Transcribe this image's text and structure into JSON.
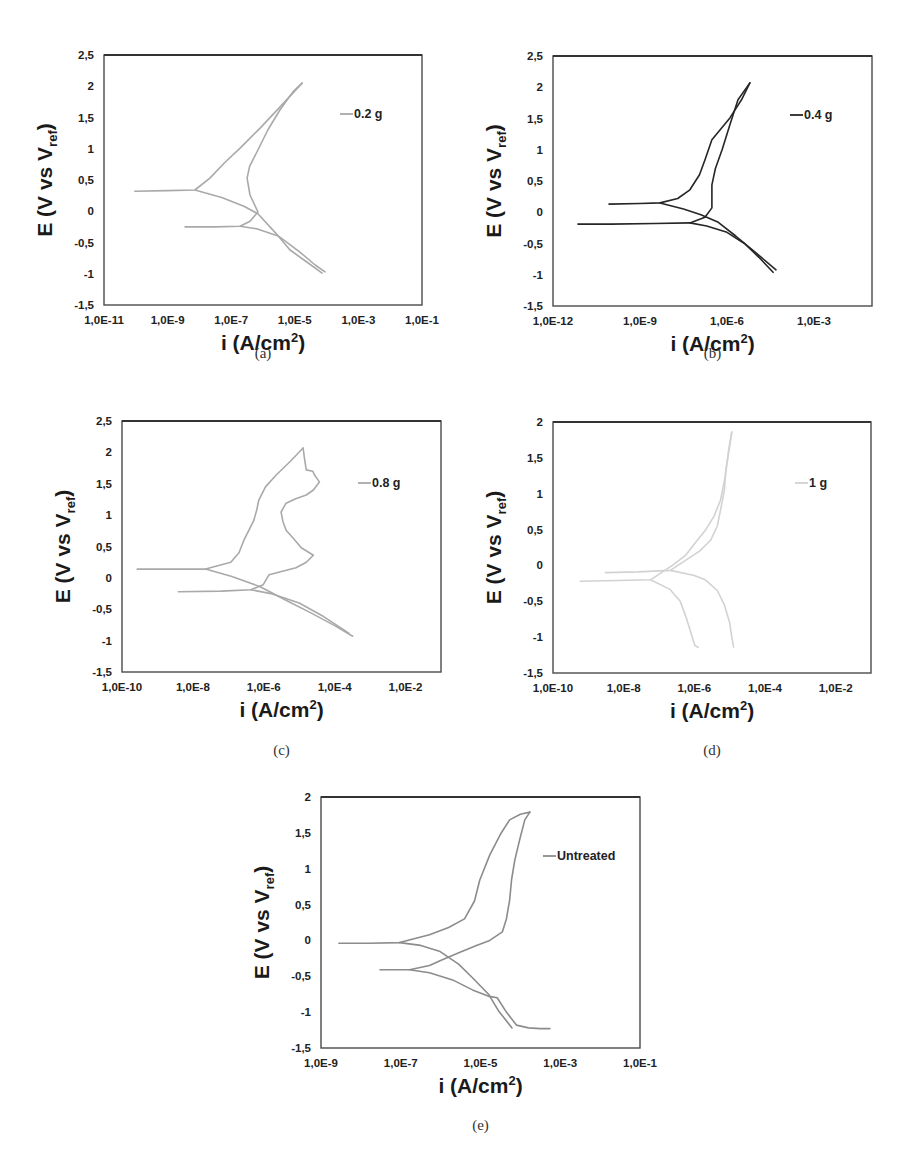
{
  "figure": {
    "header_text": ""
  },
  "chart_data": [
    {
      "id": "a",
      "type": "line",
      "caption": "(a)",
      "title": "",
      "xlabel": "i (A/cm2)",
      "xlabel_main": "i (A/cm",
      "xlabel_sup": "2",
      "xlabel_end": ")",
      "ylabel": "E (V vs Vref)",
      "ylabel_main": "E (V vs V",
      "ylabel_sub": "ref",
      "ylabel_end": ")",
      "xscale": "log",
      "xlim_log10": [
        -11,
        -1
      ],
      "ylim": [
        -1.5,
        2.5
      ],
      "xticks_log10": [
        -11,
        -9,
        -7,
        -5,
        -3,
        -1
      ],
      "xtick_labels": [
        "1,0E-11",
        "1,0E-9",
        "1,0E-7",
        "1,0E-5",
        "1,0E-3",
        "1,0E-1"
      ],
      "yticks": [
        -1.5,
        -1,
        -0.5,
        0,
        0.5,
        1,
        1.5,
        2,
        2.5
      ],
      "ytick_labels": [
        "-1,5",
        "-1",
        "-0,5",
        "0",
        "0,5",
        "1",
        "1,5",
        "2",
        "2,5"
      ],
      "grid": false,
      "legend_position": "top-right",
      "series": [
        {
          "name": "0.2 g",
          "color": "#a9a9a9",
          "segments": [
            {
              "log10_i": [
                -10.03,
                -9.0,
                -8.14,
                -7.67,
                -7.2,
                -6.72,
                -6.09,
                -5.5,
                -4.77
              ],
              "E": [
                0.32,
                0.33,
                0.34,
                0.53,
                0.78,
                1.01,
                1.33,
                1.65,
                2.05
              ]
            },
            {
              "log10_i": [
                -4.77,
                -5.06,
                -5.47,
                -5.85,
                -6.16,
                -6.42,
                -6.5,
                -6.41,
                -6.16,
                -6.41,
                -6.72,
                -7.5,
                -8.45
              ],
              "E": [
                2.05,
                1.91,
                1.62,
                1.3,
                0.98,
                0.72,
                0.53,
                0.26,
                -0.01,
                -0.16,
                -0.24,
                -0.25,
                -0.25
              ]
            },
            {
              "log10_i": [
                -8.14,
                -7.3,
                -6.6,
                -6.16,
                -5.6,
                -5.15,
                -4.6,
                -4.14
              ],
              "E": [
                0.34,
                0.22,
                0.08,
                -0.04,
                -0.35,
                -0.62,
                -0.82,
                -0.99
              ]
            },
            {
              "log10_i": [
                -6.72,
                -6.2,
                -5.5,
                -4.85,
                -4.36,
                -4.05
              ],
              "E": [
                -0.24,
                -0.28,
                -0.4,
                -0.65,
                -0.86,
                -0.97
              ]
            }
          ]
        }
      ]
    },
    {
      "id": "b",
      "type": "line",
      "caption": "(b)",
      "title": "",
      "xlabel": "i (A/cm2)",
      "xlabel_main": "i (A/cm",
      "xlabel_sup": "2",
      "xlabel_end": ")",
      "ylabel": "E (V vs Vref)",
      "ylabel_main": "E (V vs V",
      "ylabel_sub": "ref",
      "ylabel_end": ")",
      "xscale": "log",
      "xlim_log10": [
        -12,
        -1
      ],
      "ylim": [
        -1.5,
        2.5
      ],
      "xticks_log10": [
        -12,
        -9,
        -6,
        -3
      ],
      "xtick_labels": [
        "1,0E-12",
        "1,0E-9",
        "1,0E-6",
        "1,0E-3"
      ],
      "yticks": [
        -1.5,
        -1,
        -0.5,
        0,
        0.5,
        1,
        1.5,
        2,
        2.5
      ],
      "ytick_labels": [
        "-1,5",
        "-1",
        "-0,5",
        "0",
        "0,5",
        "1",
        "1,5",
        "2",
        "2,5"
      ],
      "grid": false,
      "legend_position": "top-right",
      "series": [
        {
          "name": "0.4 g",
          "color": "#262626",
          "segments": [
            {
              "log10_i": [
                -10.07,
                -9.0,
                -8.31,
                -7.7,
                -7.28,
                -6.95,
                -6.76,
                -6.52,
                -5.9,
                -5.5,
                -5.21
              ],
              "E": [
                0.13,
                0.14,
                0.15,
                0.22,
                0.36,
                0.6,
                0.84,
                1.16,
                1.51,
                1.8,
                2.07
              ]
            },
            {
              "log10_i": [
                -5.21,
                -5.62,
                -5.9,
                -6.17,
                -6.4,
                -6.52,
                -6.52,
                -6.76,
                -7.28,
                -8.5,
                -10.0,
                -11.14
              ],
              "E": [
                2.07,
                1.8,
                1.4,
                1.0,
                0.7,
                0.44,
                0.07,
                -0.08,
                -0.17,
                -0.18,
                -0.19,
                -0.19
              ]
            },
            {
              "log10_i": [
                -8.31,
                -7.5,
                -6.9,
                -6.3,
                -5.7,
                -5.0,
                -4.31
              ],
              "E": [
                0.15,
                0.05,
                -0.04,
                -0.16,
                -0.38,
                -0.65,
                -0.92
              ]
            },
            {
              "log10_i": [
                -7.28,
                -6.7,
                -6.0,
                -5.4,
                -4.9,
                -4.41
              ],
              "E": [
                -0.17,
                -0.22,
                -0.32,
                -0.5,
                -0.72,
                -0.96
              ]
            }
          ]
        }
      ]
    },
    {
      "id": "c",
      "type": "line",
      "caption": "(c)",
      "title": "",
      "xlabel": "i (A/cm2)",
      "xlabel_main": "i (A/cm",
      "xlabel_sup": "2",
      "xlabel_end": ")",
      "ylabel": "E (V vs Vref)",
      "ylabel_main": "E (V vs V",
      "ylabel_sub": "ref",
      "ylabel_end": ")",
      "xscale": "log",
      "xlim_log10": [
        -10,
        -1
      ],
      "ylim": [
        -1.5,
        2.5
      ],
      "xticks_log10": [
        -10,
        -8,
        -6,
        -4,
        -2
      ],
      "xtick_labels": [
        "1,0E-10",
        "1,0E-8",
        "1,0E-6",
        "1,0E-4",
        "1,0E-2"
      ],
      "yticks": [
        -1.5,
        -1,
        -0.5,
        0,
        0.5,
        1,
        1.5,
        2,
        2.5
      ],
      "ytick_labels": [
        "-1,5",
        "-1",
        "-0,5",
        "0",
        "0,5",
        "1",
        "1,5",
        "2",
        "2,5"
      ],
      "grid": false,
      "legend_position": "top-right",
      "series": [
        {
          "name": "0.8 g",
          "color": "#a9a9a9",
          "segments": [
            {
              "log10_i": [
                -9.57,
                -8.6,
                -7.64,
                -6.93,
                -6.7,
                -6.56,
                -6.4,
                -6.28,
                -6.2,
                -6.14,
                -5.95,
                -5.65,
                -5.25,
                -4.89
              ],
              "E": [
                0.14,
                0.14,
                0.14,
                0.25,
                0.4,
                0.6,
                0.78,
                0.92,
                1.08,
                1.24,
                1.45,
                1.64,
                1.86,
                2.07
              ]
            },
            {
              "log10_i": [
                -4.89,
                -4.85,
                -4.8,
                -4.62,
                -4.57,
                -4.43,
                -4.6,
                -4.8,
                -5.1,
                -5.37,
                -5.51,
                -5.46,
                -5.37,
                -5.15,
                -4.94,
                -4.6,
                -4.8,
                -5.09,
                -5.5,
                -5.85,
                -6.02,
                -6.36,
                -7.2,
                -8.41
              ],
              "E": [
                2.07,
                1.9,
                1.72,
                1.7,
                1.64,
                1.53,
                1.4,
                1.32,
                1.26,
                1.19,
                1.05,
                0.9,
                0.76,
                0.62,
                0.48,
                0.36,
                0.25,
                0.16,
                0.1,
                0.05,
                -0.11,
                -0.19,
                -0.21,
                -0.22
              ]
            },
            {
              "log10_i": [
                -7.64,
                -6.9,
                -6.1,
                -5.4,
                -4.7,
                -4.0,
                -3.49
              ],
              "E": [
                0.14,
                0.02,
                -0.14,
                -0.35,
                -0.55,
                -0.76,
                -0.93
              ]
            },
            {
              "log10_i": [
                -6.36,
                -5.8,
                -5.0,
                -4.3,
                -3.6
              ],
              "E": [
                -0.19,
                -0.25,
                -0.4,
                -0.62,
                -0.88
              ]
            }
          ]
        }
      ]
    },
    {
      "id": "d",
      "type": "line",
      "caption": "(d)",
      "title": "",
      "xlabel": "i (A/cm2)",
      "xlabel_main": "i (A/cm",
      "xlabel_sup": "2",
      "xlabel_end": ")",
      "ylabel": "E (V vs Vref)",
      "ylabel_main": "E (V vs V",
      "ylabel_sub": "ref",
      "ylabel_end": ")",
      "xscale": "log",
      "xlim_log10": [
        -10,
        -1
      ],
      "ylim": [
        -1.5,
        2
      ],
      "xticks_log10": [
        -10,
        -8,
        -6,
        -4,
        -2
      ],
      "xtick_labels": [
        "1,0E-10",
        "1,0E-8",
        "1,0E-6",
        "1,0E-4",
        "1,0E-2"
      ],
      "yticks": [
        -1.5,
        -1,
        -0.5,
        0,
        0.5,
        1,
        1.5,
        2
      ],
      "ytick_labels": [
        "-1,5",
        "-1",
        "-0,5",
        "0",
        "0,5",
        "1",
        "1,5",
        "2"
      ],
      "grid": false,
      "legend_position": "top-right",
      "series": [
        {
          "name": "1 g",
          "color": "#d2d2d2",
          "segments": [
            {
              "log10_i": [
                -8.52,
                -7.6,
                -6.68,
                -6.25,
                -5.85,
                -5.54,
                -5.35,
                -5.26,
                -5.15,
                -5.11,
                -5.02,
                -4.94
              ],
              "E": [
                -0.1,
                -0.09,
                -0.07,
                0.07,
                0.2,
                0.35,
                0.55,
                0.77,
                1.05,
                1.33,
                1.6,
                1.86
              ]
            },
            {
              "log10_i": [
                -4.94,
                -5.03,
                -5.12,
                -5.26,
                -5.45,
                -5.69,
                -6.0,
                -6.25,
                -6.62,
                -7.24,
                -8.2,
                -9.23
              ],
              "E": [
                1.86,
                1.61,
                1.25,
                0.91,
                0.68,
                0.49,
                0.3,
                0.14,
                0.0,
                -0.2,
                -0.21,
                -0.22
              ]
            },
            {
              "log10_i": [
                -6.68,
                -6.0,
                -5.69,
                -5.35,
                -5.15,
                -5.0,
                -4.94,
                -4.89
              ],
              "E": [
                -0.07,
                -0.14,
                -0.2,
                -0.35,
                -0.55,
                -0.8,
                -1.0,
                -1.14
              ]
            },
            {
              "log10_i": [
                -7.24,
                -6.7,
                -6.4,
                -6.25,
                -6.12,
                -6.05,
                -5.98,
                -5.89
              ],
              "E": [
                -0.2,
                -0.33,
                -0.5,
                -0.7,
                -0.9,
                -1.02,
                -1.12,
                -1.14
              ]
            }
          ]
        }
      ]
    },
    {
      "id": "e",
      "type": "line",
      "caption": "(e)",
      "title": "",
      "xlabel": "i (A/cm2)",
      "xlabel_main": "i (A/cm",
      "xlabel_sup": "2",
      "xlabel_end": ")",
      "ylabel": "E (V vs Vref)",
      "ylabel_main": "E (V vs V",
      "ylabel_sub": "ref",
      "ylabel_end": ")",
      "xscale": "log",
      "xlim_log10": [
        -9,
        -1
      ],
      "ylim": [
        -1.5,
        2
      ],
      "xticks_log10": [
        -9,
        -7,
        -5,
        -3,
        -1
      ],
      "xtick_labels": [
        "1,0E-9",
        "1,0E-7",
        "1,0E-5",
        "1,0E-3",
        "1,0E-1"
      ],
      "yticks": [
        -1.5,
        -1,
        -0.5,
        0,
        0.5,
        1,
        1.5,
        2
      ],
      "ytick_labels": [
        "-1,5",
        "-1",
        "-0,5",
        "0",
        "0,5",
        "1",
        "1,5",
        "2"
      ],
      "grid": false,
      "legend_position": "top-right",
      "series": [
        {
          "name": "Untreated",
          "color": "#8c8c8c",
          "segments": [
            {
              "log10_i": [
                -8.55,
                -7.8,
                -7.03,
                -6.28,
                -5.8,
                -5.4,
                -5.15,
                -5.02,
                -4.77,
                -4.5,
                -4.27,
                -4.0,
                -3.76
              ],
              "E": [
                -0.04,
                -0.04,
                -0.03,
                0.08,
                0.18,
                0.3,
                0.55,
                0.84,
                1.19,
                1.48,
                1.68,
                1.76,
                1.79
              ]
            },
            {
              "log10_i": [
                -3.76,
                -3.89,
                -4.02,
                -4.14,
                -4.22,
                -4.27,
                -4.35,
                -4.45,
                -4.77,
                -5.1,
                -5.53,
                -6.0,
                -6.28,
                -6.78,
                -7.2,
                -7.52
              ],
              "E": [
                1.79,
                1.68,
                1.4,
                1.12,
                0.85,
                0.56,
                0.3,
                0.12,
                0.0,
                -0.07,
                -0.17,
                -0.28,
                -0.35,
                -0.41,
                -0.41,
                -0.41
              ]
            },
            {
              "log10_i": [
                -7.03,
                -6.5,
                -6.03,
                -5.55,
                -5.2,
                -4.8,
                -4.55,
                -4.21
              ],
              "E": [
                -0.03,
                -0.07,
                -0.15,
                -0.33,
                -0.52,
                -0.75,
                -0.98,
                -1.22
              ]
            },
            {
              "log10_i": [
                -6.78,
                -6.28,
                -5.7,
                -5.2,
                -4.78,
                -4.58,
                -4.35,
                -4.1,
                -3.8,
                -3.5,
                -3.26
              ],
              "E": [
                -0.41,
                -0.45,
                -0.55,
                -0.69,
                -0.78,
                -0.8,
                -1.0,
                -1.18,
                -1.22,
                -1.23,
                -1.23
              ]
            }
          ]
        }
      ]
    }
  ]
}
